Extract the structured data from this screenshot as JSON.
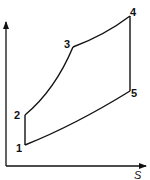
{
  "diagram": {
    "type": "T-s cycle diagram",
    "axes": {
      "x_label": "S",
      "y_label": ""
    },
    "points": [
      {
        "id": "1",
        "label": "1"
      },
      {
        "id": "2",
        "label": "2"
      },
      {
        "id": "3",
        "label": "3"
      },
      {
        "id": "4",
        "label": "4"
      },
      {
        "id": "5",
        "label": "5"
      }
    ],
    "processes": [
      {
        "from": "1",
        "to": "2",
        "shape": "vertical line"
      },
      {
        "from": "2",
        "to": "3",
        "shape": "curve"
      },
      {
        "from": "3",
        "to": "4",
        "shape": "curve"
      },
      {
        "from": "4",
        "to": "5",
        "shape": "vertical line"
      },
      {
        "from": "5",
        "to": "1",
        "shape": "curve"
      }
    ],
    "colors": {
      "line": "#111111",
      "background": "#ffffff"
    }
  }
}
